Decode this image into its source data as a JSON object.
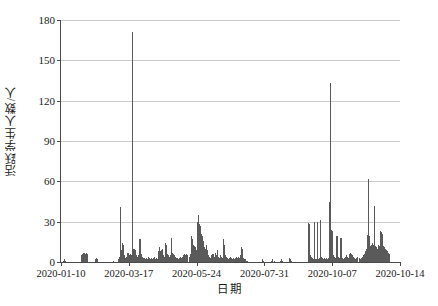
{
  "chart_data": {
    "type": "bar",
    "title": "",
    "xlabel": "日期",
    "ylabel": "活跃学生人数/人",
    "ylim": [
      0,
      180
    ],
    "ytick_labels": [
      "0",
      "30",
      "60",
      "90",
      "120",
      "150",
      "180"
    ],
    "ytick_values": [
      0,
      30,
      60,
      90,
      120,
      150,
      180
    ],
    "xtick_labels": [
      "2020-01-10",
      "2020-03-17",
      "2020-05-24",
      "2020-07-31",
      "2020-10-07",
      "2020-10-14"
    ],
    "xtick_positions": [
      0,
      67,
      134,
      201,
      268,
      335
    ],
    "grid": "horizontal",
    "legend": "none",
    "bar_color": "#5a5a5a",
    "axis_color": "#4a4a4a",
    "grid_color": "#c9c9c9",
    "n_points": 335,
    "x_start": "2020-01-10",
    "x_end": "2020-12-10",
    "values": [
      0,
      0,
      1,
      2,
      1,
      0,
      0,
      0,
      0,
      0,
      0,
      0,
      0,
      0,
      0,
      0,
      0,
      0,
      0,
      0,
      5,
      6,
      7,
      7,
      6,
      7,
      6,
      0,
      0,
      0,
      0,
      0,
      0,
      0,
      2,
      3,
      2,
      0,
      0,
      0,
      0,
      0,
      0,
      0,
      0,
      0,
      0,
      0,
      0,
      0,
      0,
      1,
      0,
      0,
      0,
      0,
      2,
      4,
      41,
      9,
      14,
      13,
      5,
      3,
      4,
      7,
      7,
      5,
      6,
      5,
      171,
      10,
      10,
      9,
      5,
      4,
      5,
      17,
      17,
      6,
      4,
      3,
      3,
      2,
      3,
      2,
      4,
      3,
      2,
      3,
      2,
      3,
      4,
      2,
      3,
      2,
      8,
      11,
      8,
      9,
      10,
      5,
      4,
      14,
      13,
      6,
      5,
      4,
      5,
      18,
      7,
      6,
      5,
      4,
      3,
      3,
      2,
      3,
      4,
      3,
      4,
      5,
      6,
      5,
      6,
      5,
      4,
      6,
      19,
      17,
      13,
      12,
      11,
      9,
      30,
      35,
      28,
      27,
      21,
      19,
      16,
      11,
      10,
      13,
      9,
      5,
      4,
      3,
      5,
      6,
      6,
      4,
      7,
      5,
      9,
      4,
      3,
      5,
      4,
      3,
      17,
      13,
      5,
      4,
      3,
      2,
      3,
      4,
      3,
      2,
      3,
      2,
      3,
      4,
      3,
      4,
      3,
      5,
      11,
      10,
      3,
      2,
      2,
      1,
      1,
      0,
      0,
      0,
      0,
      0,
      0,
      0,
      0,
      0,
      0,
      0,
      0,
      0,
      0,
      2,
      1,
      0,
      0,
      0,
      0,
      0,
      0,
      0,
      1,
      2,
      1,
      0,
      0,
      0,
      0,
      0,
      1,
      2,
      1,
      0,
      0,
      0,
      0,
      0,
      0,
      3,
      2,
      1,
      0,
      0,
      0,
      0,
      0,
      0,
      0,
      0,
      0,
      0,
      0,
      0,
      0,
      0,
      0,
      0,
      29,
      28,
      5,
      4,
      3,
      2,
      30,
      2,
      2,
      30,
      2,
      3,
      31,
      4,
      3,
      2,
      3,
      2,
      3,
      2,
      3,
      45,
      133,
      24,
      23,
      5,
      4,
      3,
      19,
      19,
      4,
      3,
      18,
      18,
      3,
      2,
      3,
      4,
      5,
      4,
      3,
      6,
      7,
      6,
      5,
      4,
      3,
      2,
      3,
      4,
      3,
      2,
      3,
      4,
      5,
      6,
      8,
      10,
      20,
      62,
      19,
      12,
      13,
      14,
      13,
      42,
      12,
      11,
      10,
      13,
      12,
      23,
      22,
      21,
      12,
      11,
      10,
      9,
      8,
      7,
      6
    ]
  }
}
